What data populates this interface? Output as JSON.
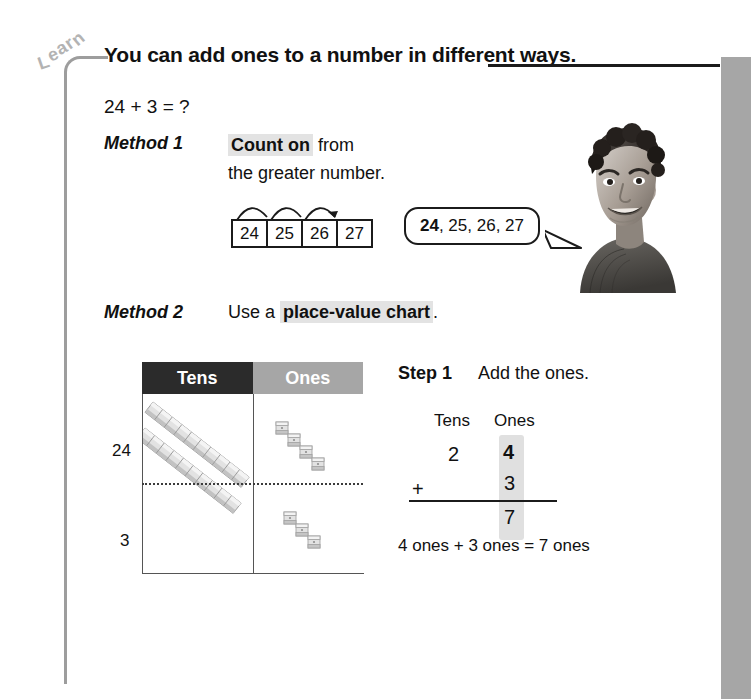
{
  "page": {
    "section_tag": "Learn",
    "heading": "You can add ones to a number in different ways.",
    "equation": "24 + 3 = ?"
  },
  "method1": {
    "label": "Method 1",
    "text_highlight": "Count on",
    "text_rest": " from",
    "text_line2": "the greater number.",
    "number_track": [
      "24",
      "25",
      "26",
      "27"
    ],
    "hop_count": 3,
    "speech_bubble": {
      "bold": "24",
      "rest": ", 25, 26, 27"
    },
    "photo_alt": "smiling-boy-photo"
  },
  "method2": {
    "label": "Method 2",
    "text_before": "Use a ",
    "text_highlight": "place-value chart",
    "text_after": ".",
    "chart": {
      "headers": [
        "Tens",
        "Ones"
      ],
      "row_labels": [
        "24",
        "3"
      ],
      "rows": [
        {
          "label": "24",
          "tens_rods": 2,
          "ones_cubes": 4
        },
        {
          "label": "3",
          "tens_rods": 0,
          "ones_cubes": 3
        }
      ]
    }
  },
  "step1": {
    "label": "Step 1",
    "text": "Add the ones.",
    "column_headers": [
      "Tens",
      "Ones"
    ],
    "operator": "+",
    "addend1": {
      "tens": "2",
      "ones": "4"
    },
    "addend2": {
      "tens": "",
      "ones": "3"
    },
    "sum": {
      "tens": "",
      "ones": "7"
    },
    "conclusion": "4 ones + 3 ones = 7 ones"
  },
  "colors": {
    "tens_header_bg": "#2b2b2b",
    "ones_header_bg": "#a6a6a6",
    "highlight": "#e3e3e3",
    "side_bar": "#a6a6a6",
    "bracket": "#9d9d9d",
    "ink": "#111111"
  }
}
